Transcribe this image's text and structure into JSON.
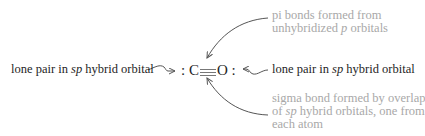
{
  "diagram": {
    "molecule": {
      "left_lone_pair": ":",
      "atom1": "C",
      "bond": "triple",
      "atom2": "O",
      "right_lone_pair": ":"
    },
    "labels": {
      "left": {
        "pre": "lone pair in ",
        "italic": "sp",
        "post": " hybrid orbital"
      },
      "right": {
        "pre": "lone pair in ",
        "italic": "sp",
        "post": " hybrid orbital"
      },
      "top": {
        "line1": "pi bonds formed from",
        "line2_pre": "unhybridized ",
        "line2_italic": "p",
        "line2_post": " orbitals"
      },
      "bottom": {
        "line1": "sigma bond formed by overlap",
        "line2_pre": "of ",
        "line2_italic": "sp",
        "line2_post": " hybrid orbitals, one from",
        "line3": "each atom"
      }
    },
    "colors": {
      "primary_text": "#1e1e1e",
      "secondary_text": "#a8a8a8",
      "arrow": "#555555"
    }
  }
}
